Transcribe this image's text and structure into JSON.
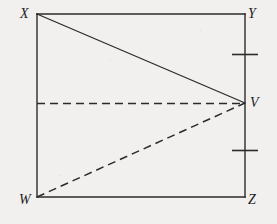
{
  "figure": {
    "background_color": "#f1f0ee",
    "stroke_color": "#2b2b2b",
    "labels": {
      "X": "X",
      "Y": "Y",
      "V": "V",
      "W": "W",
      "Z": "Z"
    },
    "points": {
      "X": {
        "x": 37,
        "y": 14
      },
      "Y": {
        "x": 245,
        "y": 14
      },
      "Z": {
        "x": 245,
        "y": 197
      },
      "W": {
        "x": 37,
        "y": 197
      },
      "V": {
        "x": 245,
        "y": 103
      },
      "M": {
        "x": 37,
        "y": 103
      }
    },
    "segments": [
      {
        "name": "rectangle-side-XY",
        "from": "X",
        "to": "Y",
        "style": "solid"
      },
      {
        "name": "rectangle-side-YZ",
        "from": "Y",
        "to": "Z",
        "style": "solid"
      },
      {
        "name": "rectangle-side-ZW",
        "from": "Z",
        "to": "W",
        "style": "solid"
      },
      {
        "name": "rectangle-side-WX",
        "from": "W",
        "to": "X",
        "style": "solid"
      },
      {
        "name": "segment-XV",
        "from": "X",
        "to": "V",
        "style": "solid"
      },
      {
        "name": "segment-MV-horizontal",
        "from": "M",
        "to": "V",
        "style": "dashed"
      },
      {
        "name": "segment-WV",
        "from": "W",
        "to": "V",
        "style": "dashed"
      }
    ],
    "tick_marks": [
      {
        "name": "tick-YV",
        "x1": 232,
        "x2": 258,
        "y": 54
      },
      {
        "name": "tick-VZ",
        "x1": 232,
        "x2": 258,
        "y": 150
      }
    ],
    "dash_pattern": "8 5"
  }
}
